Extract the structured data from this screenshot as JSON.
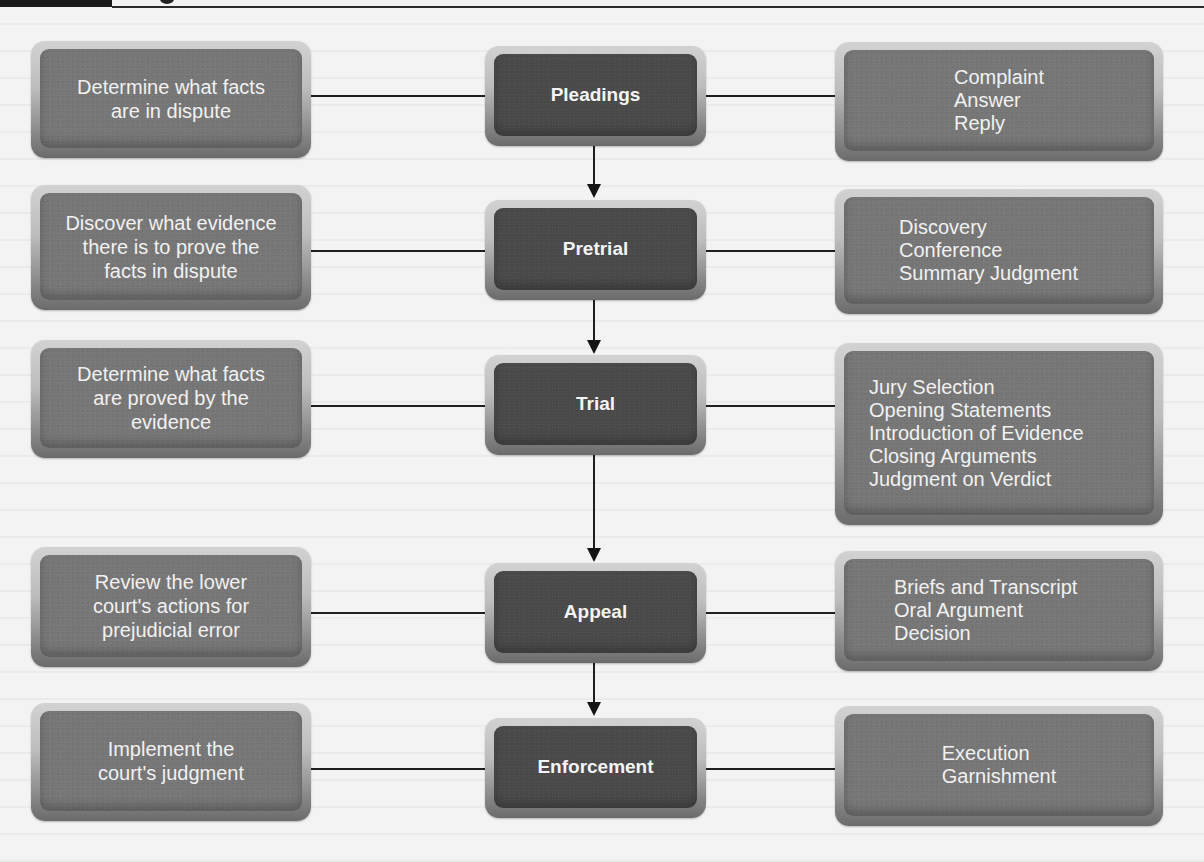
{
  "diagram": {
    "type": "flowchart",
    "stages": [
      {
        "name": "Pleadings",
        "purpose": "Determine what facts are in dispute",
        "purpose_lines": [
          "Determine what facts",
          "are in dispute"
        ],
        "steps": [
          "Complaint",
          "Answer",
          "Reply"
        ]
      },
      {
        "name": "Pretrial",
        "purpose": "Discover what evidence there is to prove the facts in dispute",
        "purpose_lines": [
          "Discover what evidence",
          "there is to prove the",
          "facts in dispute"
        ],
        "steps": [
          "Discovery",
          "Conference",
          "Summary Judgment"
        ]
      },
      {
        "name": "Trial",
        "purpose": "Determine what facts are proved by the evidence",
        "purpose_lines": [
          "Determine what facts",
          "are proved by the",
          "evidence"
        ],
        "steps": [
          "Jury Selection",
          "Opening Statements",
          "Introduction of Evidence",
          "Closing Arguments",
          "Judgment on Verdict"
        ]
      },
      {
        "name": "Appeal",
        "purpose": "Review the lower court's actions for prejudicial error",
        "purpose_lines": [
          "Review the lower",
          "court's actions for",
          "prejudicial error"
        ],
        "steps": [
          "Briefs and Transcript",
          "Oral Argument",
          "Decision"
        ]
      },
      {
        "name": "Enforcement",
        "purpose": "Implement the court's judgment",
        "purpose_lines": [
          "Implement the",
          "court's judgment"
        ],
        "steps": [
          "Execution",
          "Garnishment"
        ]
      }
    ],
    "edges": [
      {
        "from": "Pleadings",
        "to": "Pretrial",
        "type": "arrow"
      },
      {
        "from": "Pretrial",
        "to": "Trial",
        "type": "arrow"
      },
      {
        "from": "Trial",
        "to": "Appeal",
        "type": "arrow"
      },
      {
        "from": "Appeal",
        "to": "Enforcement",
        "type": "arrow"
      }
    ],
    "colors": {
      "stage_box": "#4a4a4a",
      "side_box": "#777777",
      "text": "#f1f1f1",
      "connector": "#1e1e1e"
    }
  }
}
